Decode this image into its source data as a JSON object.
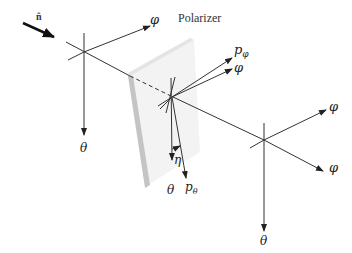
{
  "diagram": {
    "title": "Polarizer",
    "incident_direction_label": "n̂",
    "labels": {
      "phi_in": "φ",
      "theta_in": "θ",
      "p_phi": "p",
      "p_phi_sub": "φ",
      "phi_mid": "φ",
      "eta": "η",
      "theta_mid": "θ",
      "p_theta": "p",
      "p_theta_sub": "θ",
      "phi_out": "φ",
      "theta_out": "θ"
    },
    "colors": {
      "line": "#333333",
      "polarizer_face": "#f2f2f2",
      "polarizer_edge": "#c8c8c8",
      "polarizer_top": "#e6e6e6"
    }
  }
}
